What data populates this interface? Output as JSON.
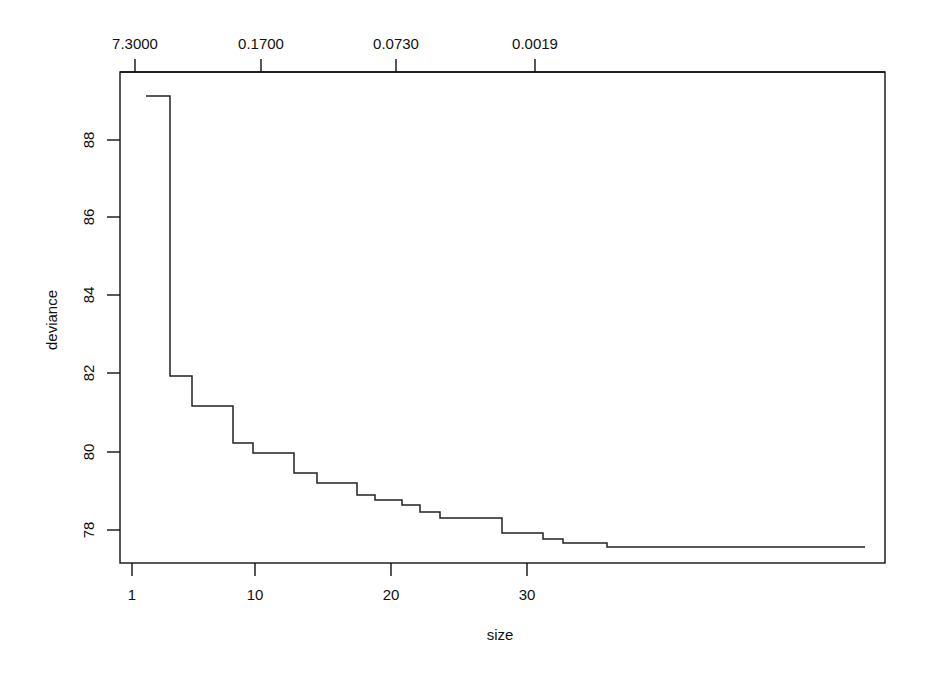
{
  "figure": {
    "background_color": "#ffffff",
    "line_color": "#222222",
    "axis_color": "#111111",
    "xlabel": "size",
    "ylabel": "deviance",
    "top_axis_label": "",
    "plot_box": {
      "left": 120,
      "right": 885,
      "top": 72,
      "bottom": 563
    }
  },
  "chart_data": {
    "type": "line",
    "title": "",
    "subtitle": "",
    "xlabel": "size",
    "ylabel": "deviance",
    "line_style": "step",
    "grid": false,
    "legend": null,
    "xlim": [
      0.1,
      35.5
    ],
    "ylim": [
      77.2,
      89.5
    ],
    "xticks": [
      1,
      10,
      20,
      30
    ],
    "xtick_labels": [
      "1",
      "10",
      "20",
      "30"
    ],
    "yticks": [
      78,
      80,
      82,
      84,
      86,
      88
    ],
    "ytick_labels": [
      "78",
      "80",
      "82",
      "84",
      "86",
      "88"
    ],
    "top_axis": {
      "label": "",
      "ticks_px": [
        135,
        261,
        396,
        535
      ],
      "tick_labels": [
        "7.3000",
        "0.1700",
        "0.0730",
        "0.0019"
      ],
      "description": "cost-complexity parameter k"
    },
    "x": [
      1,
      2,
      3,
      4,
      5,
      6,
      7,
      8,
      9,
      10,
      11,
      12,
      13,
      14,
      15,
      16,
      17,
      18,
      19,
      20,
      21,
      22,
      23,
      24,
      25,
      26,
      27,
      28,
      29,
      30,
      31,
      32,
      33,
      34,
      35
    ],
    "values": [
      89.13,
      81.93,
      81.93,
      81.16,
      81.16,
      81.16,
      80.22,
      80.22,
      79.97,
      79.97,
      79.97,
      79.46,
      79.46,
      79.2,
      79.2,
      79.2,
      78.9,
      78.9,
      78.77,
      78.77,
      78.64,
      78.46,
      78.46,
      78.3,
      78.3,
      78.3,
      77.92,
      77.92,
      77.77,
      77.77,
      77.67,
      77.67,
      77.45,
      77.45,
      77.45
    ],
    "steps_px": [
      {
        "x0": 146,
        "x1": 170,
        "y": 96
      },
      {
        "x0": 170,
        "x1": 192,
        "y": 376
      },
      {
        "x0": 192,
        "x1": 233,
        "y": 406
      },
      {
        "x0": 233,
        "x1": 253,
        "y": 443
      },
      {
        "x0": 253,
        "x1": 294,
        "y": 453
      },
      {
        "x0": 294,
        "x1": 317,
        "y": 473
      },
      {
        "x0": 317,
        "x1": 357,
        "y": 483
      },
      {
        "x0": 357,
        "x1": 375,
        "y": 495
      },
      {
        "x0": 375,
        "x1": 402,
        "y": 500
      },
      {
        "x0": 402,
        "x1": 420,
        "y": 505
      },
      {
        "x0": 420,
        "x1": 440,
        "y": 512
      },
      {
        "x0": 440,
        "x1": 502,
        "y": 518
      },
      {
        "x0": 502,
        "x1": 543,
        "y": 533
      },
      {
        "x0": 543,
        "x1": 563,
        "y": 539
      },
      {
        "x0": 563,
        "x1": 607,
        "y": 543
      },
      {
        "x0": 607,
        "x1": 865,
        "y": 547
      }
    ]
  }
}
